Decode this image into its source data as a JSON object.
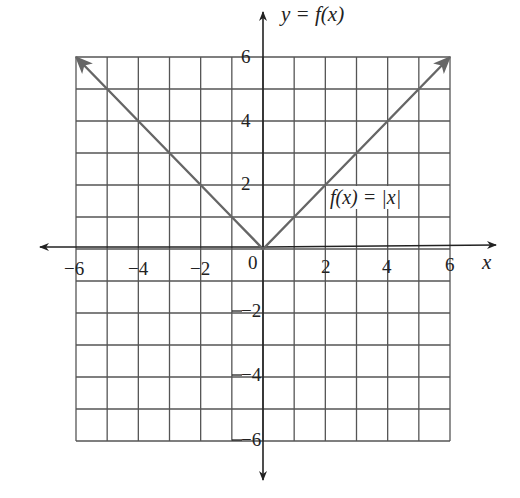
{
  "chart_data": {
    "type": "line",
    "title": "y = f(x)",
    "xlabel": "x",
    "ylabel": "y = f(x)",
    "xlim": [
      -6,
      6
    ],
    "ylim": [
      -6,
      6
    ],
    "grid": true,
    "grid_step": 1,
    "x_ticks": [
      "−6",
      "−4",
      "−2",
      "0",
      "2",
      "4",
      "6"
    ],
    "y_ticks": [
      "6",
      "4",
      "2",
      "−2",
      "−4",
      "−6"
    ],
    "series": [
      {
        "name": "f(x) = |x|",
        "x": [
          -6,
          -5,
          -4,
          -3,
          -2,
          -1,
          0,
          1,
          2,
          3,
          4,
          5,
          6
        ],
        "y": [
          6,
          5,
          4,
          3,
          2,
          1,
          0,
          1,
          2,
          3,
          4,
          5,
          6
        ],
        "arrows_at_ends": true
      }
    ],
    "annotations": [
      {
        "text": "f(x) = |x|",
        "x": 3.2,
        "y": 1.5
      }
    ],
    "colors": {
      "grid": "#555555",
      "axes": "#222222",
      "curve": "#666666",
      "background": "#ffffff"
    }
  },
  "labels": {
    "title": "y = f(x)",
    "xlabel": "x",
    "equation": "f(x) = |x|",
    "x_ticks": {
      "n6": "−6",
      "n4": "−4",
      "n2": "−2",
      "zero": "0",
      "p2": "2",
      "p4": "4",
      "p6": "6"
    },
    "y_ticks": {
      "p6": "6",
      "p4": "4",
      "p2": "2",
      "n2": "−2",
      "n4": "−4",
      "n6": "−6"
    }
  }
}
